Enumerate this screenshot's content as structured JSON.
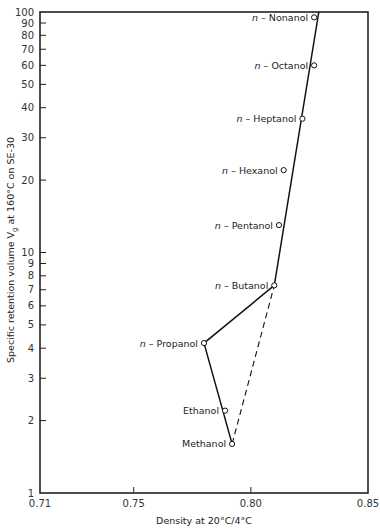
{
  "chart_data": {
    "type": "scatter",
    "title": "",
    "xlabel": "Density at 20°C/4°C",
    "ylabel": "Specific retention volume Vg at 160°C on SE-30",
    "xlim": [
      0.71,
      0.85
    ],
    "ylim": [
      1,
      100
    ],
    "yscale": "log",
    "grid": false,
    "legend": "none",
    "x_ticks": [
      "0.71",
      "0.75",
      "0.80",
      "0.85"
    ],
    "y_ticks": [
      "1",
      "2",
      "3",
      "4",
      "5",
      "6",
      "7",
      "8",
      "9",
      "10",
      "20",
      "30",
      "40",
      "50",
      "60",
      "70",
      "80",
      "90",
      "100"
    ],
    "points": [
      {
        "name": "Methanol",
        "x": 0.792,
        "y": 1.6
      },
      {
        "name": "Ethanol",
        "x": 0.789,
        "y": 2.2
      },
      {
        "name": "n-Propanol",
        "x": 0.78,
        "y": 4.2
      },
      {
        "name": "n-Butanol",
        "x": 0.81,
        "y": 7.3
      },
      {
        "name": "n-Pentanol",
        "x": 0.812,
        "y": 13
      },
      {
        "name": "n-Hexanol",
        "x": 0.814,
        "y": 22
      },
      {
        "name": "n-Heptanol",
        "x": 0.822,
        "y": 36
      },
      {
        "name": "n-Octanol",
        "x": 0.827,
        "y": 60
      },
      {
        "name": "n-Nonanol",
        "x": 0.827,
        "y": 95
      }
    ],
    "lines": [
      {
        "style": "solid",
        "path": [
          "Methanol",
          "n-Propanol",
          "n-Butanol",
          "top"
        ],
        "points": [
          [
            0.792,
            1.6
          ],
          [
            0.78,
            4.2
          ],
          [
            0.81,
            7.3
          ],
          [
            0.829,
            100
          ]
        ]
      },
      {
        "style": "dashed",
        "path": [
          "Methanol",
          "n-Butanol"
        ],
        "points": [
          [
            0.792,
            1.6
          ],
          [
            0.81,
            7.3
          ]
        ]
      }
    ]
  },
  "labels": {
    "xlabel": "Density at 20°C/4°C",
    "ylabel_main": "Specific retention volume V",
    "ylabel_sub": "g",
    "ylabel_rest": " at 160°C on SE-30"
  }
}
